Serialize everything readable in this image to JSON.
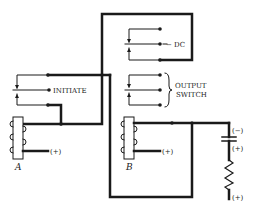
{
  "diagram": {
    "type": "relay circuit schematic",
    "labels": {
      "initiate": "INITIATE",
      "dc": "− DC",
      "output_line1": "OUTPUT",
      "output_line2": "SWITCH",
      "coil_a": "A",
      "coil_b": "B",
      "coil_a_supply": "(+)",
      "coil_b_supply": "(+)",
      "cap_negative": "(−)",
      "cap_positive": "(+)",
      "resistor_supply": "(+)"
    },
    "components": [
      {
        "id": "relay-a",
        "kind": "relay coil",
        "label": "A"
      },
      {
        "id": "relay-b",
        "kind": "relay coil",
        "label": "B"
      },
      {
        "id": "initiate-contacts",
        "kind": "transfer contact set",
        "label": "INITIATE"
      },
      {
        "id": "dc-contacts",
        "kind": "transfer contact set",
        "label": "− DC"
      },
      {
        "id": "output-contacts",
        "kind": "transfer contact set",
        "label": "OUTPUT SWITCH"
      },
      {
        "id": "capacitor",
        "kind": "capacitor",
        "polarity": [
          "(−)",
          "(+)"
        ]
      },
      {
        "id": "resistor",
        "kind": "resistor",
        "supply": "(+)"
      }
    ],
    "colors": {
      "ink": "#1a1a1a",
      "background": "#ffffff"
    }
  }
}
